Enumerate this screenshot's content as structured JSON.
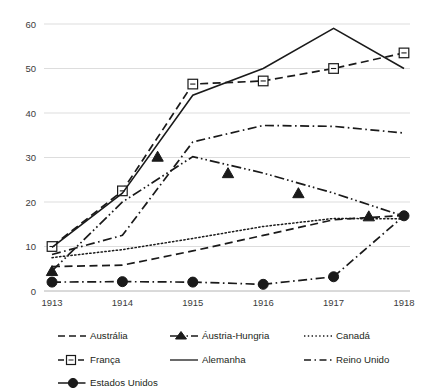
{
  "chart_data": {
    "type": "line",
    "title": "",
    "subtitle": "",
    "xlabel": "",
    "ylabel": "",
    "x": [
      1913,
      1914,
      1915,
      1916,
      1917,
      1918
    ],
    "xtick_labels": [
      "1913",
      "1914",
      "1915",
      "1916",
      "1917",
      "1918"
    ],
    "ytick_labels": [
      "0",
      "10",
      "20",
      "30",
      "40",
      "50",
      "60"
    ],
    "yticks": [
      0,
      10,
      20,
      30,
      40,
      50,
      60
    ],
    "ylim": [
      0,
      62
    ],
    "xlim": [
      1913,
      1918
    ],
    "grid": "horizontal",
    "legend_position": "bottom",
    "series": [
      {
        "name": "Austrália",
        "style": "dashed",
        "marker": "none",
        "values": [
          5.5,
          5.8,
          9.0,
          12.5,
          16.0,
          17.0
        ]
      },
      {
        "name": "Áustria-Hungria",
        "style": "dash-dot-dot",
        "marker": "triangle",
        "values": [
          4.5,
          20.0,
          30.2,
          26.5,
          22.0,
          16.8
        ],
        "marker_x": [
          1913,
          1914.5,
          1915.5,
          1916.5,
          1917.5
        ],
        "marker_values": [
          4.5,
          30.2,
          26.5,
          22.0,
          16.8
        ]
      },
      {
        "name": "Canadá",
        "style": "dotted",
        "marker": "none",
        "values": [
          7.5,
          9.3,
          11.8,
          14.5,
          16.3,
          16.2
        ]
      },
      {
        "name": "França",
        "style": "dashed",
        "marker": "open-square",
        "values": [
          10.0,
          22.5,
          46.5,
          47.2,
          50.0,
          53.5
        ]
      },
      {
        "name": "Alemanha",
        "style": "solid",
        "marker": "none",
        "values": [
          9.8,
          22.0,
          44.0,
          50.0,
          59.0,
          50.0
        ]
      },
      {
        "name": "Reino Unido",
        "style": "dash-dot",
        "marker": "none",
        "values": [
          8.2,
          12.5,
          33.5,
          37.2,
          37.0,
          35.5
        ]
      },
      {
        "name": "Estados Unidos",
        "style": "dash-dot",
        "marker": "filled-circle",
        "values": [
          2.0,
          2.1,
          2.0,
          1.5,
          3.2,
          16.9
        ]
      }
    ]
  },
  "legend": {
    "entries": [
      {
        "label": "Austrália",
        "sample": "dashed-line"
      },
      {
        "label": "Áustria-Hungria",
        "sample": "triangle-marker-line"
      },
      {
        "label": "Canadá",
        "sample": "dotted-line"
      },
      {
        "label": "França",
        "sample": "open-square-marker-line"
      },
      {
        "label": "Alemanha",
        "sample": "solid-line"
      },
      {
        "label": "Reino Unido",
        "sample": "dash-dot-line"
      },
      {
        "label": "Estados Unidos",
        "sample": "filled-circle-marker-line"
      }
    ]
  },
  "colors": {
    "ink": "#1a1a1a",
    "grid": "#d9d9d9",
    "axis": "#b4b4b4",
    "background": "#ffffff",
    "tick_text": "#3b3b3b"
  }
}
